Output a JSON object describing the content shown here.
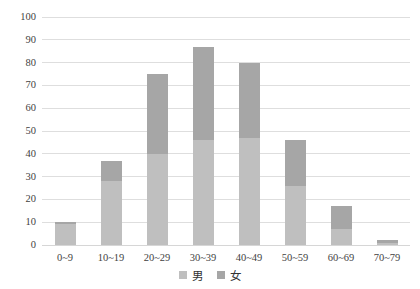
{
  "chart_data": {
    "type": "bar",
    "stacked": true,
    "title": "",
    "xlabel": "",
    "ylabel": "",
    "categories": [
      "0~9",
      "10~19",
      "20~29",
      "30~39",
      "40~49",
      "50~59",
      "60~69",
      "70~79"
    ],
    "series": [
      {
        "name": "男",
        "color": "#bfbfbf",
        "values": [
          9,
          28,
          40,
          46,
          47,
          26,
          7,
          1
        ]
      },
      {
        "name": "女",
        "color": "#a6a6a6",
        "values": [
          1,
          9,
          35,
          41,
          33,
          20,
          10,
          1
        ]
      }
    ],
    "ylim": [
      0,
      100
    ],
    "ytick_interval": 10,
    "yticks": [
      "0",
      "10",
      "20",
      "30",
      "40",
      "50",
      "60",
      "70",
      "80",
      "90",
      "100"
    ],
    "grid": "horizontal",
    "gridline_color": "#dedede",
    "legend_position": "bottom",
    "background_color": "#ffffff",
    "text_color": "#3f3f3f"
  },
  "legend": {
    "items": [
      {
        "label": "男",
        "color": "#bfbfbf"
      },
      {
        "label": "女",
        "color": "#a6a6a6"
      }
    ]
  }
}
